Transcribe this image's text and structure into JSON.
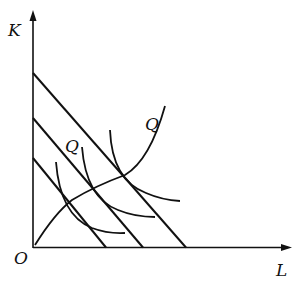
{
  "diagram": {
    "title": "",
    "axes": {
      "y_label": "K",
      "x_label": "L",
      "origin_label": "O"
    },
    "curve_labels": {
      "isoquant_label_1": "Q",
      "isoquant_label_2": "Q"
    },
    "elements": {
      "isocost_lines": 3,
      "isoquant_curves": 3,
      "expansion_path": 1
    },
    "colors": {
      "line": "#111111",
      "background": "#ffffff"
    }
  }
}
